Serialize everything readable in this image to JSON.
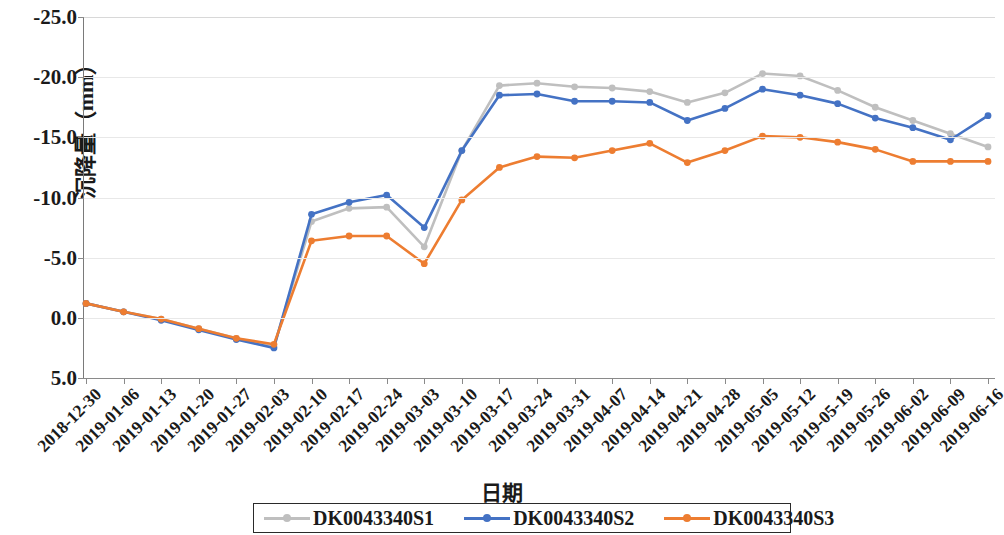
{
  "chart_data": {
    "type": "line",
    "title": "",
    "xlabel": "日期",
    "ylabel": "沉降量（mm）",
    "ylim": [
      5.0,
      -25.0
    ],
    "y_inverted": true,
    "grid": true,
    "legend_position": "bottom",
    "yticks": [
      "-25.0",
      "-20.0",
      "-15.0",
      "-10.0",
      "-5.0",
      "0.0",
      "5.0"
    ],
    "ytick_values": [
      -25.0,
      -20.0,
      -15.0,
      -10.0,
      -5.0,
      0.0,
      5.0
    ],
    "categories": [
      "2018-12-30",
      "2019-01-06",
      "2019-01-13",
      "2019-01-20",
      "2019-01-27",
      "2019-02-03",
      "2019-02-10",
      "2019-02-17",
      "2019-02-24",
      "2019-03-03",
      "2019-03-10",
      "2019-03-17",
      "2019-03-24",
      "2019-03-31",
      "2019-04-07",
      "2019-04-14",
      "2019-04-21",
      "2019-04-28",
      "2019-05-05",
      "2019-05-12",
      "2019-05-19",
      "2019-05-26",
      "2019-06-02",
      "2019-06-09",
      "2019-06-16"
    ],
    "series": [
      {
        "name": "DK0043340S1",
        "color": "#bfbfbf",
        "marker_color": "#bfbfbf",
        "values": [
          -1.2,
          -0.5,
          0.1,
          0.9,
          1.7,
          2.4,
          -8.0,
          -9.1,
          -9.2,
          -5.9,
          -13.9,
          -19.3,
          -19.5,
          -19.2,
          -19.1,
          -18.8,
          -17.9,
          -18.7,
          -20.3,
          -20.1,
          -18.9,
          -17.5,
          -16.4,
          -15.3,
          -14.2
        ]
      },
      {
        "name": "DK0043340S2",
        "color": "#4472c4",
        "marker_color": "#4472c4",
        "values": [
          -1.2,
          -0.5,
          0.2,
          1.0,
          1.8,
          2.5,
          -8.6,
          -9.6,
          -10.2,
          -7.5,
          -13.9,
          -18.5,
          -18.6,
          -18.0,
          -18.0,
          -17.9,
          -16.4,
          -17.4,
          -19.0,
          -18.5,
          -17.8,
          -16.6,
          -15.8,
          -14.8,
          -16.8
        ]
      },
      {
        "name": "DK0043340S3",
        "color": "#ed7d31",
        "marker_color": "#ed7d31",
        "values": [
          -1.2,
          -0.5,
          0.1,
          0.9,
          1.7,
          2.2,
          -6.4,
          -6.8,
          -6.8,
          -4.5,
          -9.8,
          -12.5,
          -13.4,
          -13.3,
          -13.9,
          -14.5,
          -12.9,
          -13.9,
          -15.1,
          -15.0,
          -14.6,
          -14.0,
          -13.0,
          -13.0,
          -13.0
        ]
      }
    ]
  },
  "legend": {
    "items": [
      {
        "label": "DK0043340S1"
      },
      {
        "label": "DK0043340S2"
      },
      {
        "label": "DK0043340S3"
      }
    ]
  }
}
